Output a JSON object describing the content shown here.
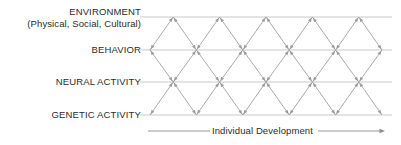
{
  "diagram": {
    "title_levels": [
      {
        "id": "environment",
        "label": "ENVIRONMENT",
        "sublabel": "(Physical, Social, Cultural)",
        "y": 17
      },
      {
        "id": "behavior",
        "label": "BEHAVIOR",
        "sublabel": "",
        "y": 50
      },
      {
        "id": "neural-activity",
        "label": "NEURAL ACTIVITY",
        "sublabel": "",
        "y": 82
      },
      {
        "id": "genetic-activity",
        "label": "GENETIC ACTIVITY",
        "sublabel": "",
        "y": 115
      }
    ],
    "axis": {
      "caption": "Individual Development",
      "y": 131,
      "line_start_x": 148,
      "line_end_x": 385,
      "arrow_direction": "right"
    },
    "lattice": {
      "start_x": 150,
      "half_cell": 23.2,
      "columns": 10,
      "rows": 3,
      "bidirectional": true
    },
    "colors": {
      "text": "#2b2b2b",
      "level_line": "#c9c9c9",
      "arrow": "#9a9a9a",
      "axis_line": "#8d8d8d",
      "background": "#ffffff"
    },
    "icons": {
      "arrow_right": "right-arrow-icon",
      "arrow_up_diagonal": "diagonal-up-arrow-icon",
      "arrow_down_diagonal": "diagonal-down-arrow-icon"
    }
  }
}
